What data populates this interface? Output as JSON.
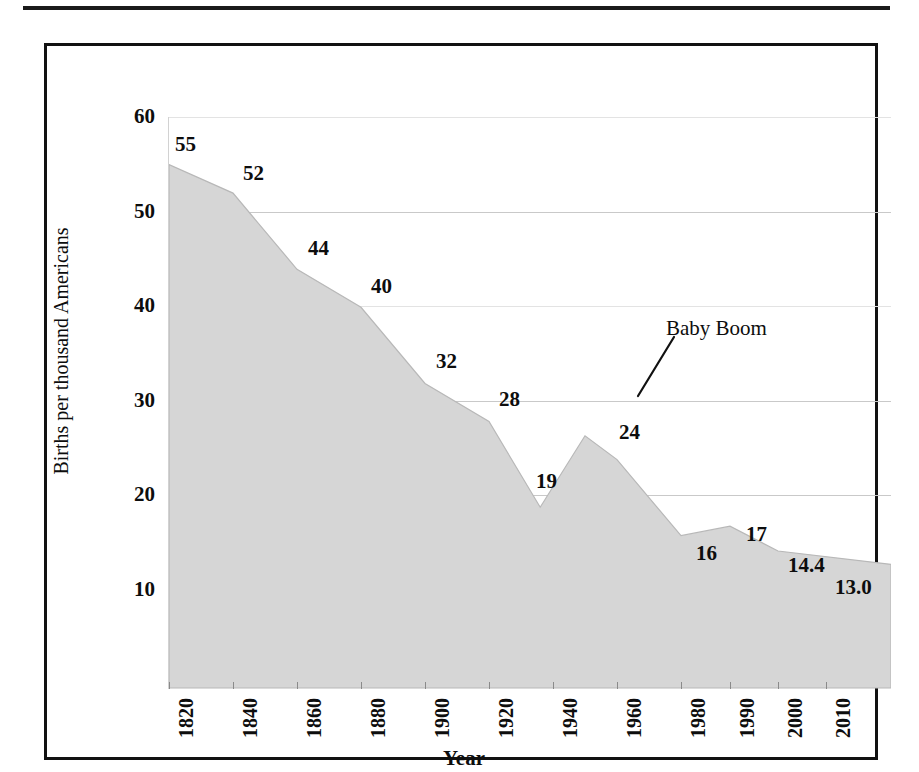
{
  "figure": {
    "frame": true,
    "page_rule": true
  },
  "chart_data": {
    "type": "area",
    "title": "",
    "subtitle": "",
    "xlabel": "Year",
    "ylabel": "Births per thousand Americans",
    "xlim": [
      1820,
      2010
    ],
    "ylim": [
      0,
      60
    ],
    "grid": true,
    "legend": null,
    "fill_color": "#d6d6d6",
    "line_color": "#b8b8b8",
    "grid_color": "#c9c9c9",
    "axis_label_color": "#0d0d0d",
    "x_ticks": [
      "1820",
      "1840",
      "1860",
      "1880",
      "1900",
      "1920",
      "1940",
      "1960",
      "1980",
      "1990",
      "2000",
      "2010"
    ],
    "y_ticks": [
      "60",
      "50",
      "40",
      "30",
      "20",
      "10"
    ],
    "x": [
      1820,
      1840,
      1860,
      1880,
      1900,
      1920,
      1936,
      1950,
      1960,
      1980,
      1990,
      2000,
      2010
    ],
    "values": [
      55,
      52,
      44,
      40,
      32,
      28,
      19,
      26.5,
      24,
      16,
      17,
      14.4,
      13.0
    ],
    "point_labels": [
      {
        "text": "55",
        "year": 1820,
        "value": 55
      },
      {
        "text": "52",
        "year": 1840,
        "value": 52
      },
      {
        "text": "44",
        "year": 1860,
        "value": 44
      },
      {
        "text": "40",
        "year": 1880,
        "value": 40
      },
      {
        "text": "32",
        "year": 1900,
        "value": 32
      },
      {
        "text": "28",
        "year": 1920,
        "value": 28
      },
      {
        "text": "19",
        "year": 1936,
        "value": 19
      },
      {
        "text": "24",
        "year": 1960,
        "value": 24
      },
      {
        "text": "16",
        "year": 1980,
        "value": 16
      },
      {
        "text": "17",
        "year": 1990,
        "value": 17
      },
      {
        "text": "14.4",
        "year": 2000,
        "value": 14.4
      },
      {
        "text": "13.0",
        "year": 2010,
        "value": 13.0
      }
    ],
    "annotations": [
      {
        "text": "Baby Boom",
        "target_year": 1948,
        "target_value": 25.5
      }
    ]
  }
}
